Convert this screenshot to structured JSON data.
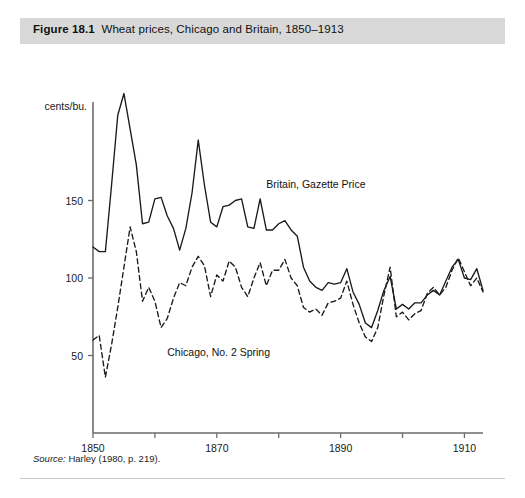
{
  "figure": {
    "number": "Figure 18.1",
    "caption": "Wheat prices, Chicago and Britain, 1850–1913",
    "source": "Harley (1980, p. 219).",
    "source_label": "Source:"
  },
  "colors": {
    "caption_band": "#d8d8d8",
    "axis": "#6b6b6b",
    "britain_line": "#1a1a1a",
    "chicago_line": "#1a1a1a",
    "page_background": "#ffffff",
    "rule": "#c9c9c9"
  },
  "chart_data": {
    "type": "line",
    "title": "Wheat prices, Chicago and Britain, 1850–1913",
    "xlabel": "",
    "ylabel": "cents/bu.",
    "xlim": [
      1850,
      1913
    ],
    "ylim": [
      0,
      230
    ],
    "grid": false,
    "legend": "inline-annotation",
    "xticks": [
      1850,
      1860,
      1870,
      1880,
      1890,
      1900,
      1910
    ],
    "xtick_labels": [
      "1850",
      "",
      "1870",
      "",
      "1890",
      "",
      "1910"
    ],
    "yticks": [
      50,
      100,
      150
    ],
    "ytick_labels": [
      "50",
      "100",
      "150"
    ],
    "annotations": [
      {
        "text": "Britain, Gazette Price",
        "x": 1878,
        "y": 158
      },
      {
        "text": "Chicago, No. 2 Spring",
        "x": 1862,
        "y": 50
      }
    ],
    "x": [
      1850,
      1851,
      1852,
      1853,
      1854,
      1855,
      1856,
      1857,
      1858,
      1859,
      1860,
      1861,
      1862,
      1863,
      1864,
      1865,
      1866,
      1867,
      1868,
      1869,
      1870,
      1871,
      1872,
      1873,
      1874,
      1875,
      1876,
      1877,
      1878,
      1879,
      1880,
      1881,
      1882,
      1883,
      1884,
      1885,
      1886,
      1887,
      1888,
      1889,
      1890,
      1891,
      1892,
      1893,
      1894,
      1895,
      1896,
      1897,
      1898,
      1899,
      1900,
      1901,
      1902,
      1903,
      1904,
      1905,
      1906,
      1907,
      1908,
      1909,
      1910,
      1911,
      1912,
      1913
    ],
    "series": [
      {
        "name": "Britain, Gazette Price",
        "style": "solid",
        "values": [
          120,
          117,
          117,
          160,
          205,
          219,
          196,
          173,
          135,
          136,
          151,
          152,
          140,
          132,
          118,
          132,
          155,
          189,
          160,
          136,
          133,
          146,
          147,
          150,
          151,
          133,
          132,
          151,
          131,
          131,
          135,
          137,
          131,
          127,
          107,
          98,
          94,
          92,
          97,
          96,
          97,
          106,
          91,
          83,
          71,
          68,
          79,
          92,
          101,
          80,
          83,
          80,
          84,
          84,
          89,
          92,
          89,
          98,
          107,
          112,
          100,
          99,
          106,
          92
        ]
      },
      {
        "name": "Chicago, No. 2 Spring",
        "style": "dashed",
        "values": [
          60,
          63,
          36,
          57,
          81,
          107,
          133,
          117,
          85,
          94,
          85,
          68,
          74,
          87,
          97,
          95,
          107,
          114,
          108,
          88,
          102,
          98,
          111,
          107,
          94,
          88,
          100,
          110,
          95,
          105,
          105,
          112,
          100,
          95,
          81,
          78,
          80,
          76,
          84,
          85,
          87,
          98,
          83,
          71,
          62,
          59,
          68,
          89,
          107,
          75,
          78,
          73,
          77,
          79,
          90,
          94,
          89,
          94,
          105,
          113,
          104,
          95,
          100,
          91
        ]
      }
    ]
  }
}
